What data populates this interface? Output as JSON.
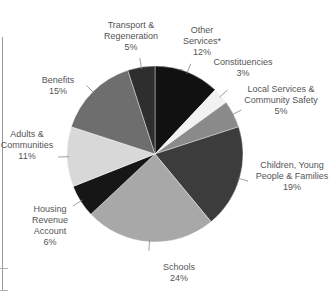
{
  "chart_data": {
    "type": "pie",
    "title": "",
    "start_angle_deg": 0,
    "direction": "clockwise",
    "slices": [
      {
        "label": "Other Services*",
        "value": 12,
        "display": "12%",
        "color": "#111111"
      },
      {
        "label": "Constituencies",
        "value": 3,
        "display": "3%",
        "color": "#f2f2f2"
      },
      {
        "label": "Local Services & Community Safety",
        "value": 5,
        "display": "5%",
        "color": "#8a8a8a"
      },
      {
        "label": "Children, Young People & Families",
        "value": 19,
        "display": "19%",
        "color": "#3c3c3c"
      },
      {
        "label": "Schools",
        "value": 24,
        "display": "24%",
        "color": "#a8a8a8"
      },
      {
        "label": "Housing Revenue Account",
        "value": 6,
        "display": "6%",
        "color": "#161616"
      },
      {
        "label": "Adults & Communities",
        "value": 11,
        "display": "11%",
        "color": "#d8d8d8"
      },
      {
        "label": "Benefits",
        "value": 15,
        "display": "15%",
        "color": "#6e6e6e"
      },
      {
        "label": "Transport & Regeneration",
        "value": 5,
        "display": "5%",
        "color": "#2e2e2e"
      }
    ],
    "legend": "none (callout labels)"
  },
  "labels": {
    "other": {
      "lines": [
        "Other",
        "Services*"
      ],
      "pct": "12%"
    },
    "constituencies": {
      "lines": [
        "Constituencies"
      ],
      "pct": "3%"
    },
    "local": {
      "lines": [
        "Local Services &",
        "Community Safety"
      ],
      "pct": "5%"
    },
    "children": {
      "lines": [
        "Children, Young",
        "People & Families"
      ],
      "pct": "19%"
    },
    "schools": {
      "lines": [
        "Schools"
      ],
      "pct": "24%"
    },
    "housing": {
      "lines": [
        "Housing",
        "Revenue",
        "Account"
      ],
      "pct": "6%"
    },
    "adults": {
      "lines": [
        "Adults &",
        "Communities"
      ],
      "pct": "11%"
    },
    "benefits": {
      "lines": [
        "Benefits"
      ],
      "pct": "15%"
    },
    "transport": {
      "lines": [
        "Transport &",
        "Regeneration"
      ],
      "pct": "5%"
    }
  }
}
